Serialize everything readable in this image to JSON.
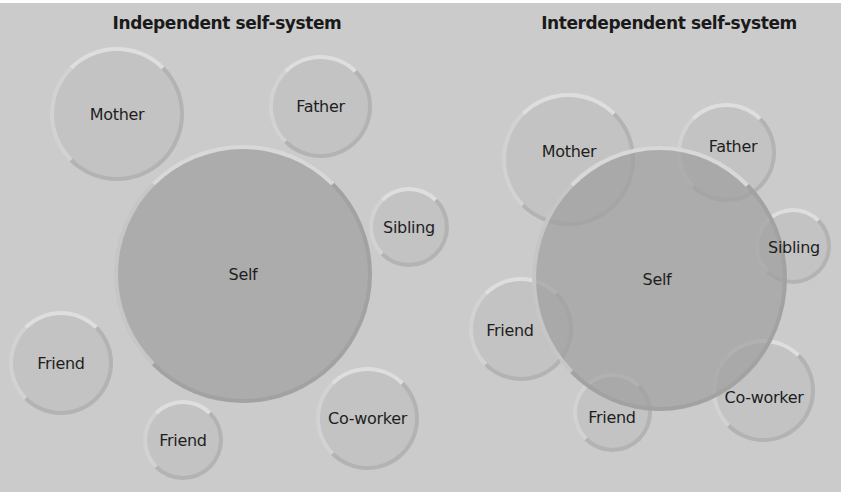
{
  "colors": {
    "background": "#cbcbcb",
    "small_circle": "#bebebe",
    "self_circle": "#a0a0a0",
    "text": "#1e1e1e"
  },
  "independent": {
    "title": "Independent self-system",
    "self": "Self",
    "others": [
      "Mother",
      "Father",
      "Sibling",
      "Friend",
      "Friend",
      "Co-worker"
    ]
  },
  "interdependent": {
    "title": "Interdependent self-system",
    "self": "Self",
    "others": [
      "Mother",
      "Father",
      "Sibling",
      "Friend",
      "Friend",
      "Co-worker"
    ]
  }
}
